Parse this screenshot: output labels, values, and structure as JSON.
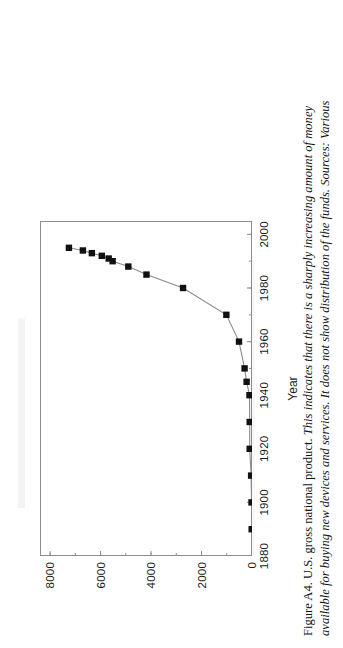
{
  "figure": {
    "caption_label": "Figure A4.",
    "caption_title": "U.S. gross national product.",
    "caption_body_line1": "This indicates that there is a sharply increasing amount of money",
    "caption_body_line2": "available for buying new devices and services. It does not show distribution of the funds. Sources: Various"
  },
  "axes": {
    "x_title": "Year",
    "y_title": "Dollars (Billions)",
    "x_ticks": [
      "1880",
      "1900",
      "1920",
      "1940",
      "1960",
      "1980",
      "2000"
    ],
    "y_ticks": [
      "0",
      "2000",
      "4000",
      "6000",
      "8000"
    ]
  },
  "chart_data": {
    "type": "line",
    "title": "U.S. gross national product.",
    "xlabel": "Year",
    "ylabel": "Dollars (Billions)",
    "xlim": [
      1880,
      2005
    ],
    "ylim": [
      0,
      8400
    ],
    "xticks": [
      1880,
      1900,
      1920,
      1940,
      1960,
      1980,
      2000
    ],
    "yticks": [
      0,
      2000,
      4000,
      6000,
      8000
    ],
    "grid": false,
    "legend": "none",
    "marker": "square",
    "marker_color": "#111111",
    "line_color": "#8a8a8a",
    "series": [
      {
        "name": "U.S. gross national product",
        "x": [
          1890,
          1900,
          1910,
          1920,
          1930,
          1940,
          1945,
          1950,
          1960,
          1970,
          1980,
          1985,
          1988,
          1990,
          1991,
          1992,
          1993,
          1994,
          1995
        ],
        "values": [
          13,
          19,
          35,
          91,
          91,
          100,
          213,
          294,
          515,
          1016,
          2732,
          4181,
          4900,
          5522,
          5678,
          5951,
          6345,
          6700,
          7254
        ]
      }
    ]
  }
}
